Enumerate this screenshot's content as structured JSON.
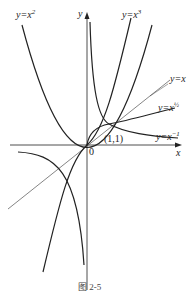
{
  "figure": {
    "caption": "图 2-5",
    "axes": {
      "x_label": "x",
      "y_label": "y",
      "origin_label": "0"
    },
    "point_label": "(1,1)",
    "curves": [
      {
        "name": "y=x^2",
        "label_base": "y=x",
        "label_exp": "2"
      },
      {
        "name": "y=x^3",
        "label_base": "y=x",
        "label_exp": "3"
      },
      {
        "name": "y=x",
        "label_base": "y=x",
        "label_exp": ""
      },
      {
        "name": "y=x^(1/2)",
        "label_base": "y=x",
        "label_exp": "½"
      },
      {
        "name": "y=x^(-1)",
        "label_base": "y=x",
        "label_exp": "−1"
      }
    ]
  }
}
